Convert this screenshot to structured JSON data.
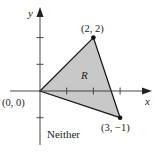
{
  "figure": {
    "axes": {
      "x_label": "x",
      "y_label": "y",
      "x_ticks": [
        1,
        2,
        3
      ],
      "y_ticks": [
        -1,
        1,
        2
      ]
    },
    "region": {
      "label": "R",
      "vertices": [
        {
          "x": 0,
          "y": 0,
          "label": "(0, 0)"
        },
        {
          "x": 2,
          "y": 2,
          "label": "(2, 2)"
        },
        {
          "x": 3,
          "y": -1,
          "label": "(3, −1)"
        }
      ],
      "fill_color": "#c8c8c8",
      "stroke_color": "#1a1a1a"
    },
    "caption": "Neither"
  }
}
